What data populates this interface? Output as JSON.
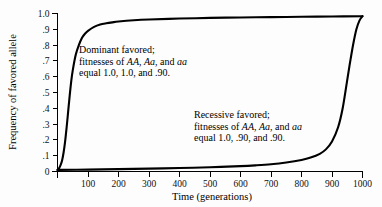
{
  "chart_data": {
    "type": "line",
    "title": "",
    "subtitle": "",
    "xlabel": "Time (generations)",
    "ylabel": "Frequency of favored allele",
    "xlim": [
      0,
      1000
    ],
    "ylim": [
      0,
      1.0
    ],
    "grid": false,
    "legend_position": "inline-annotations",
    "x_ticks": [
      100,
      200,
      300,
      400,
      500,
      600,
      700,
      800,
      900,
      1000
    ],
    "x_tick_labels": [
      "100",
      "200",
      "300",
      "400",
      "500",
      "600",
      "700",
      "800",
      "900",
      "1000"
    ],
    "y_ticks": [
      0,
      0.1,
      0.2,
      0.3,
      0.4,
      0.5,
      0.6,
      0.7,
      0.8,
      0.9,
      1.0
    ],
    "y_tick_labels": [
      "0",
      ".1",
      ".2",
      ".3",
      ".4",
      ".5",
      ".6",
      ".7",
      ".8",
      ".9",
      "1.0"
    ],
    "series": [
      {
        "name": "Dominant favored",
        "x": [
          0,
          5,
          10,
          15,
          20,
          25,
          30,
          35,
          40,
          45,
          50,
          60,
          70,
          80,
          90,
          100,
          120,
          140,
          160,
          180,
          200,
          250,
          300,
          400,
          500,
          600,
          700,
          800,
          900,
          1000
        ],
        "values": [
          0.01,
          0.02,
          0.04,
          0.07,
          0.12,
          0.19,
          0.28,
          0.38,
          0.48,
          0.57,
          0.64,
          0.74,
          0.8,
          0.845,
          0.872,
          0.89,
          0.915,
          0.93,
          0.938,
          0.944,
          0.949,
          0.957,
          0.962,
          0.968,
          0.972,
          0.975,
          0.977,
          0.979,
          0.981,
          0.983
        ]
      },
      {
        "name": "Recessive favored",
        "x": [
          0,
          100,
          200,
          300,
          400,
          500,
          600,
          650,
          700,
          750,
          800,
          830,
          860,
          880,
          900,
          920,
          935,
          950,
          960,
          970,
          980,
          990,
          1000
        ],
        "values": [
          0.01,
          0.012,
          0.015,
          0.018,
          0.022,
          0.027,
          0.034,
          0.039,
          0.046,
          0.057,
          0.073,
          0.088,
          0.112,
          0.14,
          0.19,
          0.28,
          0.4,
          0.58,
          0.7,
          0.81,
          0.9,
          0.955,
          0.983
        ]
      }
    ],
    "annotations": [
      {
        "id": "dominant",
        "lines": [
          [
            {
              "t": "Dominant favored;",
              "style": "normal"
            }
          ],
          [
            {
              "t": "fitnesses of ",
              "style": "normal"
            },
            {
              "t": "AA",
              "style": "italic"
            },
            {
              "t": ", ",
              "style": "normal"
            },
            {
              "t": "Aa",
              "style": "italic"
            },
            {
              "t": ", and ",
              "style": "normal"
            },
            {
              "t": "aa",
              "style": "italic"
            }
          ],
          [
            {
              "t": "equal 1.0, 1.0, and .90.",
              "style": "normal"
            }
          ]
        ]
      },
      {
        "id": "recessive",
        "lines": [
          [
            {
              "t": "Recessive favored;",
              "style": "normal"
            }
          ],
          [
            {
              "t": "fitnesses of ",
              "style": "normal"
            },
            {
              "t": "AA",
              "style": "italic"
            },
            {
              "t": ", ",
              "style": "normal"
            },
            {
              "t": "Aa",
              "style": "italic"
            },
            {
              "t": ", and ",
              "style": "normal"
            },
            {
              "t": "aa",
              "style": "italic"
            }
          ],
          [
            {
              "t": "equal 1.0, .90, and .90.",
              "style": "normal"
            }
          ]
        ]
      }
    ],
    "colors": {
      "line": "#000000",
      "axis": "#000000",
      "background": "#fdfdfd",
      "text": "#000000"
    }
  }
}
